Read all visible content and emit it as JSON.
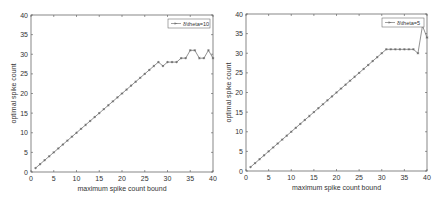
{
  "chart_data": [
    {
      "type": "line",
      "title": "",
      "xlabel": "maximum spike count bound",
      "ylabel": "optimal spike count",
      "xlim": [
        0,
        40
      ],
      "ylim": [
        0,
        40
      ],
      "xticks": [
        "0",
        "5",
        "10",
        "15",
        "20",
        "25",
        "30",
        "35",
        "40"
      ],
      "yticks": [
        "0",
        "5",
        "10",
        "15",
        "20",
        "25",
        "30",
        "35",
        "40"
      ],
      "grid": false,
      "legend_position": "top-right",
      "series": [
        {
          "name": "δ\\theta=10",
          "marker": "*",
          "color": "#777777",
          "x": [
            1,
            2,
            3,
            4,
            5,
            6,
            7,
            8,
            9,
            10,
            11,
            12,
            13,
            14,
            15,
            16,
            17,
            18,
            19,
            20,
            21,
            22,
            23,
            24,
            25,
            26,
            27,
            28,
            29,
            30,
            31,
            32,
            33,
            34,
            35,
            36,
            37,
            38,
            39,
            40
          ],
          "y": [
            1,
            2,
            3,
            4,
            5,
            6,
            7,
            8,
            9,
            10,
            11,
            12,
            13,
            14,
            15,
            16,
            17,
            18,
            19,
            20,
            21,
            22,
            23,
            24,
            25,
            26,
            27,
            28,
            27,
            28,
            28,
            28,
            29,
            29,
            31,
            31,
            29,
            29,
            31,
            29
          ]
        }
      ]
    },
    {
      "type": "line",
      "title": "",
      "xlabel": "maximum spike count bound",
      "ylabel": "optimal spike count",
      "xlim": [
        0,
        40
      ],
      "ylim": [
        0,
        40
      ],
      "xticks": [
        "0",
        "5",
        "10",
        "15",
        "20",
        "25",
        "30",
        "35",
        "40"
      ],
      "yticks": [
        "0",
        "5",
        "10",
        "15",
        "20",
        "25",
        "30",
        "35",
        "40"
      ],
      "grid": false,
      "legend_position": "top-right",
      "series": [
        {
          "name": "δ\\theta=5",
          "marker": "*",
          "color": "#777777",
          "x": [
            1,
            2,
            3,
            4,
            5,
            6,
            7,
            8,
            9,
            10,
            11,
            12,
            13,
            14,
            15,
            16,
            17,
            18,
            19,
            20,
            21,
            22,
            23,
            24,
            25,
            26,
            27,
            28,
            29,
            30,
            31,
            32,
            33,
            34,
            35,
            36,
            37,
            38,
            39,
            40
          ],
          "y": [
            1,
            2,
            3,
            4,
            5,
            6,
            7,
            8,
            9,
            10,
            11,
            12,
            13,
            14,
            15,
            16,
            17,
            18,
            19,
            20,
            21,
            22,
            23,
            24,
            25,
            26,
            27,
            28,
            29,
            30,
            31,
            31,
            31,
            31,
            31,
            31,
            31,
            30,
            37,
            34
          ]
        }
      ]
    }
  ]
}
